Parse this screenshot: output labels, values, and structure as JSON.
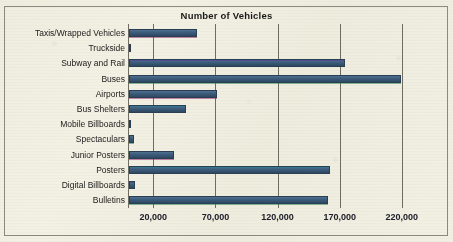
{
  "chart_data": {
    "type": "bar",
    "orientation": "horizontal",
    "title": "Number of Vehicles",
    "xlabel": "",
    "ylabel": "",
    "grid": true,
    "legend": "none",
    "xlim": [
      0,
      240000
    ],
    "xticks": [
      20000,
      70000,
      120000,
      170000,
      220000
    ],
    "xtick_labels": [
      "20,000",
      "70,000",
      "120,000",
      "170,000",
      "220,000"
    ],
    "categories": [
      "Taxis/Wrapped Vehicles",
      "Truckside",
      "Subway and Rail",
      "Buses",
      "Airports",
      "Bus Shelters",
      "Mobile Billboards",
      "Spectaculars",
      "Junior Posters",
      "Posters",
      "Digital Billboards",
      "Bulletins"
    ],
    "values": [
      55000,
      2000,
      174000,
      219000,
      71000,
      46000,
      2000,
      4000,
      36000,
      162000,
      5000,
      160000
    ],
    "bar_color": "#3f5f80",
    "bar_edge_color": "#2a3f55",
    "plot_background": "#efedde",
    "axis_color": "#6f6d62"
  },
  "chart": {
    "title": "Number of Vehicles"
  }
}
